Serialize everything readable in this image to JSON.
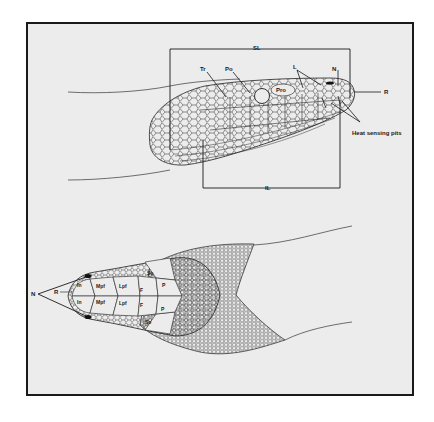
{
  "figure": {
    "background": "#ececec",
    "ink": "#1a1a1a",
    "lateral_view": {
      "measurement_labels": {
        "snout_length": "SL",
        "interocular_length": "IL"
      },
      "scale_labels": {
        "temporal": "Tr",
        "postocular": "Po",
        "preocular": "Pro",
        "labials": "L",
        "nostril": "N",
        "rostral": "R"
      },
      "annotation": "Heat sensing pits"
    },
    "dorsal_view": {
      "pointer_labels": {
        "nostril": "N",
        "rostral": "R"
      },
      "scale_labels": {
        "internasal_left": "In",
        "internasal_right": "In",
        "median_prefrontal_left": "Mpf",
        "median_prefrontal_right": "Mpf",
        "lateral_prefrontal_left": "Lpf",
        "lateral_prefrontal_right": "Lpf",
        "frontal_left": "F",
        "frontal_right": "F",
        "supraocular_top": "So",
        "supraocular_bottom": "So",
        "parietal_top": "P",
        "parietal_bottom": "P"
      }
    }
  }
}
